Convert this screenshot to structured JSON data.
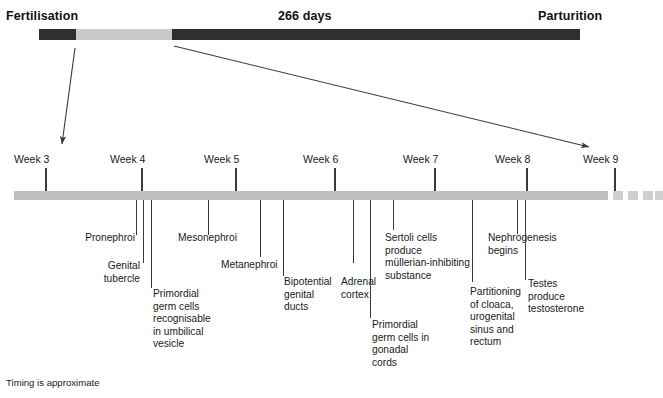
{
  "figure": {
    "title_left": "Fertilisation",
    "title_center": "266 days",
    "title_right": "Parturition",
    "footnote": "Timing is approximate",
    "colors": {
      "bar_dark": "#2f2f2f",
      "bar_light": "#c9c9c9",
      "week_bar": "#bfbfbf",
      "week_dash": "#cfcfcf",
      "tick": "#3a3a3a",
      "text": "#1a1a1a"
    }
  },
  "gestation_bar": {
    "segments": [
      {
        "name": "pre-embryonic",
        "x": 39,
        "width": 37,
        "color": "#2f2f2f"
      },
      {
        "name": "embryonic-early",
        "x": 76,
        "width": 96,
        "color": "#c9c9c9"
      },
      {
        "name": "fetal",
        "x": 172,
        "width": 408,
        "color": "#2f2f2f"
      }
    ]
  },
  "arrows": [
    {
      "name": "fertilisation-to-week3",
      "x1": 75,
      "y1": 48,
      "x2": 62,
      "y2": 144
    },
    {
      "name": "embryonic-to-week9",
      "x1": 174,
      "y1": 46,
      "x2": 589,
      "y2": 147
    }
  ],
  "week_axis": {
    "bar": {
      "x": 14,
      "width": 594
    },
    "dashes": [
      {
        "x": 613,
        "width": 10
      },
      {
        "x": 628,
        "width": 10
      },
      {
        "x": 643,
        "width": 10
      },
      {
        "x": 655,
        "width": 8
      }
    ],
    "weeks": [
      {
        "label": "Week 3",
        "label_x": 14,
        "tick_x": 45
      },
      {
        "label": "Week 4",
        "label_x": 110,
        "tick_x": 141
      },
      {
        "label": "Week 5",
        "label_x": 204,
        "tick_x": 235
      },
      {
        "label": "Week 6",
        "label_x": 303,
        "tick_x": 334
      },
      {
        "label": "Week 7",
        "label_x": 403,
        "tick_x": 434
      },
      {
        "label": "Week 8",
        "label_x": 495,
        "tick_x": 526
      },
      {
        "label": "Week 9",
        "label_x": 583,
        "tick_x": 614
      }
    ]
  },
  "events": [
    {
      "name": "pronephroi",
      "text": "Pronephroi",
      "lead_x": 136,
      "lead_height": 35,
      "text_x": 27,
      "text_y": 232,
      "width": 108,
      "align": "right"
    },
    {
      "name": "genital-tubercle",
      "text": "Genital\ntubercle",
      "lead_x": 143,
      "lead_height": 63,
      "text_x": 34,
      "text_y": 260,
      "width": 106,
      "align": "right"
    },
    {
      "name": "primordial-germ-cells-umbilical-vesicle",
      "text": "Primordial\ngerm cells\nrecognisable\nin umbilical\nvesicle",
      "lead_x": 151,
      "lead_height": 88,
      "text_x": 153,
      "text_y": 288,
      "width": 80,
      "align": "left"
    },
    {
      "name": "mesonephroi",
      "text": "Mesonephroi",
      "lead_x": 208,
      "lead_height": 35,
      "text_x": 178,
      "text_y": 232,
      "width": 95,
      "align": "left"
    },
    {
      "name": "metanephroi",
      "text": "Metanephroi",
      "lead_x": 260,
      "lead_height": 57,
      "text_x": 221,
      "text_y": 259,
      "width": 92,
      "align": "left"
    },
    {
      "name": "bipotential-genital-ducts",
      "text": "Bipotential\ngenital\nducts",
      "lead_x": 283,
      "lead_height": 76,
      "text_x": 284,
      "text_y": 276,
      "width": 70,
      "align": "left"
    },
    {
      "name": "adrenal-cortex",
      "text": "Adrenal\ncortex",
      "lead_x": 353,
      "lead_height": 63,
      "text_x": 341,
      "text_y": 276,
      "width": 62,
      "align": "left"
    },
    {
      "name": "primordial-germ-cells-gonadal-cords",
      "text": "Primordial\ngerm cells in\ngonadal\ncords",
      "lead_x": 370,
      "lead_height": 118,
      "text_x": 372,
      "text_y": 319,
      "width": 86,
      "align": "left"
    },
    {
      "name": "sertoli-cells-mis",
      "text": "Sertoli cells\nproduce\nmüllerian-inhibiting\nsubstance",
      "lead_x": 393,
      "lead_height": 30,
      "text_x": 385,
      "text_y": 232,
      "width": 115,
      "align": "left"
    },
    {
      "name": "partitioning-cloaca",
      "text": "Partitioning\nof cloaca,\nurogenital\nsinus and\nrectum",
      "lead_x": 472,
      "lead_height": 82,
      "text_x": 470,
      "text_y": 286,
      "width": 70,
      "align": "left"
    },
    {
      "name": "nephrogenesis-begins",
      "text": "Nephrogenesis\nbegins",
      "lead_x": 517,
      "lead_height": 34,
      "text_x": 488,
      "text_y": 232,
      "width": 92,
      "align": "left"
    },
    {
      "name": "testes-produce-testosterone",
      "text": "Testes\nproduce\ntestosterone",
      "lead_x": 525,
      "lead_height": 80,
      "text_x": 528,
      "text_y": 278,
      "width": 80,
      "align": "left"
    }
  ]
}
